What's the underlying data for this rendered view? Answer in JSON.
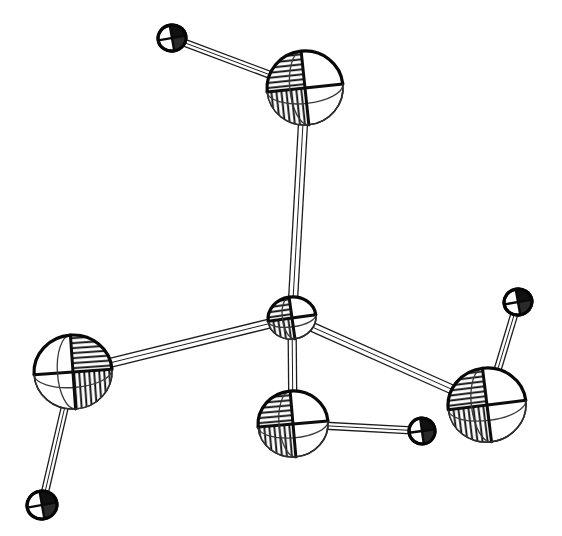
{
  "figure": {
    "caption": "",
    "background_color": "#ffffff",
    "line_color": "#111111",
    "width": 562,
    "height": 536,
    "style": "ortep-thermal-ellipsoid-line-drawing"
  },
  "chart_data": {
    "type": "scatter",
    "subtitle": "",
    "xlabel": "",
    "ylabel": "",
    "xlim": [
      0,
      562
    ],
    "ylim": [
      0,
      536
    ],
    "grid": false,
    "legend": "none",
    "atoms": [
      {
        "id": "A1",
        "label": "",
        "role": "central-atom",
        "x": 292,
        "y": 318,
        "rx": 24,
        "ry": 21,
        "rotation": -8,
        "kind": "ellipsoid",
        "size": "small",
        "shaded_quadrant": "upper-left",
        "outline_color": "#111111",
        "fill_color": "#ffffff"
      },
      {
        "id": "A2",
        "label": "",
        "role": "substituent-atom",
        "x": 305,
        "y": 88,
        "rx": 38,
        "ry": 37,
        "rotation": -6,
        "kind": "ellipsoid",
        "size": "large",
        "shaded_quadrant": "upper-left",
        "outline_color": "#111111",
        "fill_color": "#ffffff"
      },
      {
        "id": "A3",
        "label": "",
        "role": "substituent-atom",
        "x": 73,
        "y": 372,
        "rx": 39,
        "ry": 37,
        "rotation": -4,
        "kind": "ellipsoid",
        "size": "large",
        "shaded_quadrant": "right-half",
        "outline_color": "#111111",
        "fill_color": "#ffffff"
      },
      {
        "id": "A4",
        "label": "",
        "role": "substituent-atom",
        "x": 293,
        "y": 424,
        "rx": 35,
        "ry": 33,
        "rotation": -5,
        "kind": "ellipsoid",
        "size": "large",
        "shaded_quadrant": "upper-left",
        "outline_color": "#111111",
        "fill_color": "#ffffff"
      },
      {
        "id": "A5",
        "label": "",
        "role": "substituent-atom",
        "x": 487,
        "y": 405,
        "rx": 39,
        "ry": 37,
        "rotation": -7,
        "kind": "ellipsoid",
        "size": "large",
        "shaded_quadrant": "upper-left",
        "outline_color": "#111111",
        "fill_color": "#ffffff"
      },
      {
        "id": "H1",
        "label": "",
        "role": "hydrogen-atom",
        "x": 172,
        "y": 38,
        "rx": 14,
        "ry": 13,
        "rotation": -10,
        "kind": "sphere",
        "size": "tiny",
        "shaded_quadrant": "upper-right",
        "outline_color": "#0a0a0a",
        "fill_color": "#ffffff"
      },
      {
        "id": "H2",
        "label": "",
        "role": "hydrogen-atom",
        "x": 42,
        "y": 505,
        "rx": 15,
        "ry": 14,
        "rotation": -10,
        "kind": "sphere",
        "size": "tiny",
        "shaded_quadrant": "upper-right",
        "outline_color": "#0a0a0a",
        "fill_color": "#ffffff"
      },
      {
        "id": "H3",
        "label": "",
        "role": "hydrogen-atom",
        "x": 422,
        "y": 431,
        "rx": 13,
        "ry": 13,
        "rotation": -8,
        "kind": "sphere",
        "size": "tiny",
        "shaded_quadrant": "upper-right",
        "outline_color": "#0a0a0a",
        "fill_color": "#ffffff"
      },
      {
        "id": "H4",
        "label": "",
        "role": "hydrogen-atom",
        "x": 518,
        "y": 302,
        "rx": 14,
        "ry": 13,
        "rotation": -10,
        "kind": "sphere",
        "size": "tiny",
        "shaded_quadrant": "upper-right",
        "outline_color": "#0a0a0a",
        "fill_color": "#ffffff"
      }
    ],
    "bonds": [
      {
        "id": "B1",
        "from": "A1",
        "to": "A2",
        "style": "open-rod",
        "rod_width": 9,
        "lines": 3
      },
      {
        "id": "B2",
        "from": "A1",
        "to": "A3",
        "style": "open-rod",
        "rod_width": 9,
        "lines": 3
      },
      {
        "id": "B3",
        "from": "A1",
        "to": "A4",
        "style": "open-rod",
        "rod_width": 8,
        "lines": 3
      },
      {
        "id": "B4",
        "from": "A1",
        "to": "A5",
        "style": "open-rod",
        "rod_width": 9,
        "lines": 3
      },
      {
        "id": "B5",
        "from": "A2",
        "to": "H1",
        "style": "open-rod",
        "rod_width": 7,
        "lines": 3
      },
      {
        "id": "B6",
        "from": "A3",
        "to": "H2",
        "style": "open-rod",
        "rod_width": 7,
        "lines": 3
      },
      {
        "id": "B7",
        "from": "A4",
        "to": "H3",
        "style": "open-rod",
        "rod_width": 7,
        "lines": 3
      },
      {
        "id": "B8",
        "from": "A5",
        "to": "H4",
        "style": "open-rod",
        "rod_width": 7,
        "lines": 3
      }
    ]
  }
}
